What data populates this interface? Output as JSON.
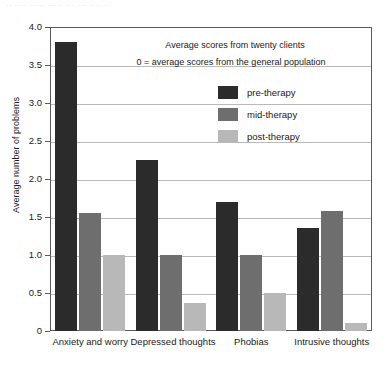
{
  "caption_strip": "·· ···· ····· ····· ··· ··· ···· ··",
  "chart_data": {
    "type": "bar",
    "title": "",
    "xlabel": "",
    "ylabel": "Average number of problems",
    "ylim": [
      0,
      4.0
    ],
    "ytick_values": [
      "4.0",
      "3.5",
      "3.0",
      "2.5",
      "2.0",
      "1.5",
      "1.0",
      "0.5",
      "0"
    ],
    "grid": true,
    "legend_position": "inside-upper-center",
    "categories": [
      "Anxiety and worry",
      "Depressed thoughts",
      "Phobias",
      "Intrusive thoughts"
    ],
    "series": [
      {
        "name": "pre-therapy",
        "color": "#2b2b2b",
        "values": [
          3.8,
          2.25,
          1.7,
          1.35
        ]
      },
      {
        "name": "mid-therapy",
        "color": "#6e6e6e",
        "values": [
          1.55,
          1.0,
          1.0,
          1.58
        ]
      },
      {
        "name": "post-therapy",
        "color": "#b8b8b8",
        "values": [
          1.0,
          0.37,
          0.5,
          0.1
        ]
      }
    ],
    "annotations": [
      "Average scores from twenty clients",
      "0 = average scores from the general population"
    ]
  },
  "legend": {
    "items": [
      {
        "label": "pre-therapy"
      },
      {
        "label": "mid-therapy"
      },
      {
        "label": "post-therapy"
      }
    ]
  }
}
